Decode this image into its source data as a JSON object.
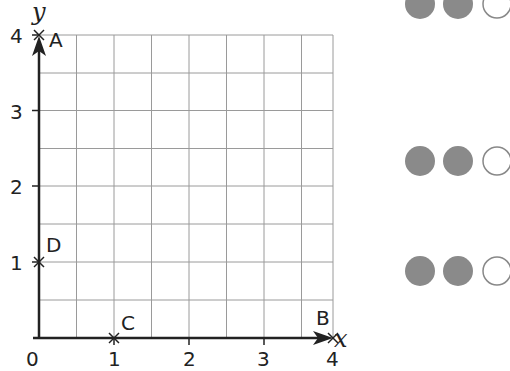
{
  "graph": {
    "axis_labels": {
      "x": "x",
      "y": "y"
    },
    "x_ticks": [
      "0",
      "1",
      "2",
      "3",
      "4"
    ],
    "y_ticks": [
      "1",
      "2",
      "3",
      "4"
    ],
    "range": {
      "x": [
        0,
        4
      ],
      "y": [
        0,
        4
      ]
    },
    "grid_step": 0.5,
    "points": [
      {
        "label": "A",
        "x": 0,
        "y": 4
      },
      {
        "label": "B",
        "x": 4,
        "y": 0
      },
      {
        "label": "C",
        "x": 1,
        "y": 0
      },
      {
        "label": "D",
        "x": 0,
        "y": 1
      }
    ]
  },
  "counter_rows": [
    {
      "filled": 2,
      "empty": 1
    },
    {
      "filled": 2,
      "empty": 1
    },
    {
      "filled": 2,
      "empty": 1
    }
  ],
  "colors": {
    "filled_counter": "#8a8a8a",
    "grid": "#9a9a9a",
    "axis": "#222222"
  }
}
